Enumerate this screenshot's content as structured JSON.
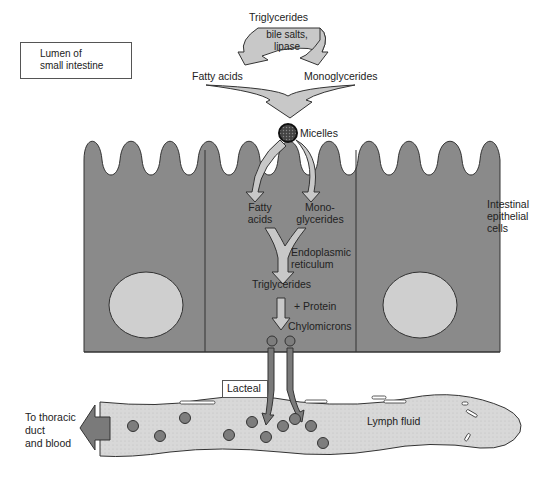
{
  "diagram": {
    "lumen_label": [
      "Lumen of",
      "small intestine"
    ],
    "digestion": {
      "input": "Triglycerides",
      "enzymes": [
        "bile salts,",
        "lipase"
      ],
      "products": [
        "Fatty acids",
        "Monoglycerides"
      ]
    },
    "micelles": "Micelles",
    "epithelium": {
      "label": [
        "Intestinal",
        "epithelial",
        "cells"
      ],
      "absorbed": {
        "left": [
          "Fatty",
          "acids"
        ],
        "right": [
          "Mono-",
          "glycerides"
        ]
      },
      "er_label": [
        "Endoplasmic",
        "reticulum"
      ],
      "resynthesized": "Triglycerides",
      "plus_protein": "+ Protein",
      "chylomicrons": "Chylomicrons"
    },
    "lacteal": "Lacteal",
    "lymph_fluid": "Lymph fluid",
    "exit_label": [
      "To thoracic",
      "duct",
      "and blood"
    ],
    "colors": {
      "cell_fill": "#8a8a8a",
      "nucleus_fill": "#cfcfcf",
      "arrow_fill": "#c8c8c8",
      "lymph_fill": "#d9d9d9",
      "chylomicron_fill": "#7d7d7d",
      "exit_arrow_fill": "#7a7a7a",
      "outline": "#333333"
    }
  }
}
